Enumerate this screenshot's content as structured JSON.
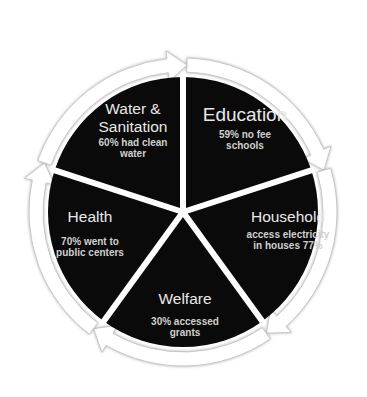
{
  "diagram": {
    "type": "cycle-pie",
    "colors": {
      "segment_fill": "#0a0a0a",
      "divider": "#ffffff",
      "arrow_ring": "#ffffff",
      "arrow_outline": "#c8c8c8",
      "text": "#e8e8e8"
    },
    "segments": [
      {
        "id": "education",
        "title": "Education",
        "detail": "59% no fee schools"
      },
      {
        "id": "household",
        "title": "Household",
        "detail": "access electricity in houses 77%"
      },
      {
        "id": "welfare",
        "title": "Welfare",
        "detail": "30% accessed grants"
      },
      {
        "id": "health",
        "title": "Health",
        "detail": "70% went to public centers"
      },
      {
        "id": "water-sanitation",
        "title": "Water & Sanitation",
        "detail": "60% had clean water"
      }
    ],
    "labels": {
      "education": {
        "title": "Education",
        "detail_line1": "59% no fee",
        "detail_line2": "schools"
      },
      "household": {
        "title": "Household",
        "detail_line1": "access electricity",
        "detail_line2": "in houses 77%"
      },
      "welfare": {
        "title": "Welfare",
        "detail_line1": "30% accessed",
        "detail_line2": "grants"
      },
      "health": {
        "title": "Health",
        "detail_line1": "70% went to",
        "detail_line2": "public centers"
      },
      "water": {
        "title_line1": "Water &",
        "title_line2": "Sanitation",
        "detail_line1": "60% had clean",
        "detail_line2": "water"
      }
    },
    "flow_direction": "clockwise"
  }
}
